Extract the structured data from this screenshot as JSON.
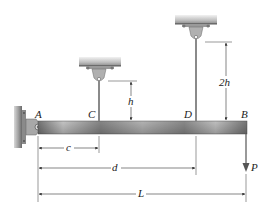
{
  "figure": {
    "points": {
      "A": "A",
      "B": "B",
      "C": "C",
      "D": "D"
    },
    "dimensions": {
      "c": "c",
      "d": "d",
      "L": "L",
      "h": "h",
      "two_h": "2h"
    },
    "load": {
      "label": "P",
      "direction": "down"
    },
    "colors": {
      "beam_dark": "#6e6e6e",
      "beam_light": "#c9c9c9",
      "support": "#8a8a8a",
      "wall": "#7a7a7a",
      "line": "#333333"
    }
  }
}
